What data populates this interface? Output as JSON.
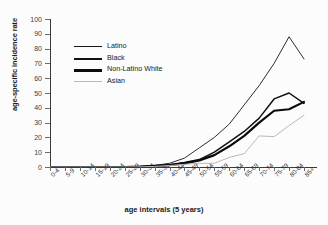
{
  "figure": {
    "title_partial": "",
    "background": "#ffffff"
  },
  "axes": {
    "y_title": "age-specific incidence rate",
    "x_title": "age intervals (5 years)",
    "y_ticks": [
      "0",
      "10",
      "20",
      "30",
      "40",
      "50",
      "60",
      "70",
      "80",
      "90",
      "100"
    ]
  },
  "legend": {
    "items": [
      {
        "label": "Latino",
        "color": "#15151a",
        "width": "1.4px"
      },
      {
        "label": "Black",
        "color": "#101014",
        "width": "2.0px"
      },
      {
        "label": "Non-Latino White",
        "color": "#0a0a0c",
        "width": "2.6px"
      },
      {
        "label": "Asian",
        "color": "#b9b9bc",
        "width": "1.2px"
      }
    ]
  },
  "chart_data": {
    "type": "line",
    "title": "",
    "xlabel": "age intervals (5 years)",
    "ylabel": "age-specific incidence rate",
    "ylim": [
      0,
      100
    ],
    "ytick_step": 10,
    "grid": false,
    "legend_position": "upper-left-inside",
    "categories": [
      "0-4",
      "5-9",
      "10-14",
      "15-19",
      "20-24",
      "25-29",
      "30-34",
      "35-39",
      "40-44",
      "45-49",
      "50-54",
      "55-59",
      "60-64",
      "65-69",
      "70-74",
      "75-79",
      "80-84",
      "85+"
    ],
    "series": [
      {
        "name": "Latino",
        "color": "#15151a",
        "values": [
          0,
          0,
          0,
          0,
          0,
          0,
          0.3,
          1,
          2.5,
          6,
          13,
          20,
          29,
          42,
          55,
          70,
          88,
          73
        ]
      },
      {
        "name": "Black",
        "color": "#101014",
        "values": [
          0,
          0,
          0,
          0,
          0,
          0,
          0.2,
          0.8,
          1.5,
          3,
          5,
          10,
          17,
          24,
          33,
          46,
          50,
          43
        ]
      },
      {
        "name": "Non-Latino White",
        "color": "#0a0a0c",
        "values": [
          0,
          0,
          0,
          0,
          0,
          0,
          0.2,
          0.7,
          1.3,
          2.5,
          4.5,
          8,
          14,
          21,
          30,
          38,
          39,
          44
        ]
      },
      {
        "name": "Asian",
        "color": "#b9b9bc",
        "values": [
          0,
          0,
          0,
          0,
          0,
          0,
          0.1,
          0.4,
          1,
          1.8,
          2.5,
          2.5,
          6.5,
          9,
          21,
          20.5,
          28,
          35
        ]
      }
    ]
  }
}
